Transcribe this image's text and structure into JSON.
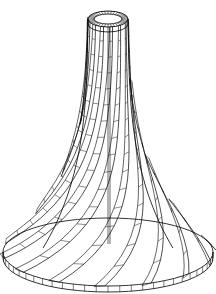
{
  "figure": {
    "stroke_color": "#000000",
    "background": "#ffffff",
    "top_ring": {
      "cx": 108,
      "cy": 19,
      "rx": 20,
      "ry": 8,
      "inner_rx": 14,
      "inner_ry": 5
    },
    "base_disk": {
      "cx": 108,
      "cy": 252,
      "rx": 105,
      "ry": 34,
      "thickness": 6
    },
    "blade_count": 14
  }
}
